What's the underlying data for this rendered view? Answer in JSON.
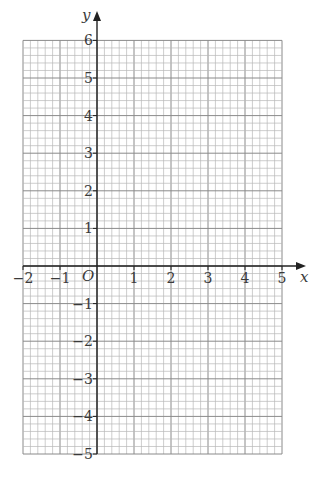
{
  "chart_data": {
    "type": "scatter",
    "title": "",
    "xlabel": "x",
    "ylabel": "y",
    "origin_label": "O",
    "xlim": [
      -2,
      5
    ],
    "ylim": [
      -5,
      6
    ],
    "x_ticks": [
      -2,
      -1,
      1,
      2,
      3,
      4,
      5
    ],
    "y_ticks": [
      6,
      5,
      4,
      3,
      2,
      1,
      -1,
      -2,
      -3,
      -4,
      -5
    ],
    "x_tick_labels": [
      "−2",
      "−1",
      "1",
      "2",
      "3",
      "4",
      "5"
    ],
    "y_tick_labels": [
      "6",
      "5",
      "4",
      "3",
      "2",
      "1",
      "−1",
      "−2",
      "−3",
      "−4",
      "−5"
    ],
    "grid": true,
    "minor_divisions_per_unit": 5,
    "series": [],
    "colors": {
      "grid_minor": "#b8b8b8",
      "grid_major": "#8a8a8a",
      "axis": "#222222",
      "text": "#3a3a3a"
    }
  }
}
